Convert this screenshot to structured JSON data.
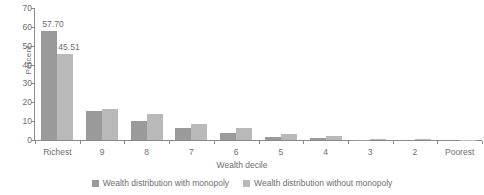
{
  "chart_data": {
    "type": "bar",
    "title": "",
    "xlabel": "Wealth decile",
    "ylabel": "Percent",
    "ylim": [
      0,
      70
    ],
    "yticks": [
      0,
      10,
      20,
      30,
      40,
      50,
      60,
      70
    ],
    "grid": false,
    "legend_position": "bottom",
    "categories": [
      "Richest",
      "9",
      "8",
      "7",
      "6",
      "5",
      "4",
      "3",
      "2",
      "Poorest"
    ],
    "series": [
      {
        "name": "Wealth distribution with monopoly",
        "color": "#9a9a9a",
        "values": [
          57.7,
          15.3,
          9.9,
          6.3,
          3.8,
          1.8,
          0.9,
          0.2,
          0.0,
          0.0
        ]
      },
      {
        "name": "Wealth distribution without monopoly",
        "color": "#b9b9b9",
        "values": [
          45.51,
          16.7,
          13.6,
          8.5,
          6.5,
          3.0,
          2.0,
          0.5,
          0.8,
          0.1
        ]
      }
    ],
    "annotations": [
      {
        "text": "57.70",
        "series": 0,
        "category": "Richest"
      },
      {
        "text": "45.51",
        "series": 1,
        "category": "Richest"
      }
    ]
  },
  "legend": {
    "items": [
      {
        "label": "Wealth distribution with monopoly",
        "color": "#9a9a9a"
      },
      {
        "label": "Wealth distribution without monopoly",
        "color": "#b9b9b9"
      }
    ]
  }
}
